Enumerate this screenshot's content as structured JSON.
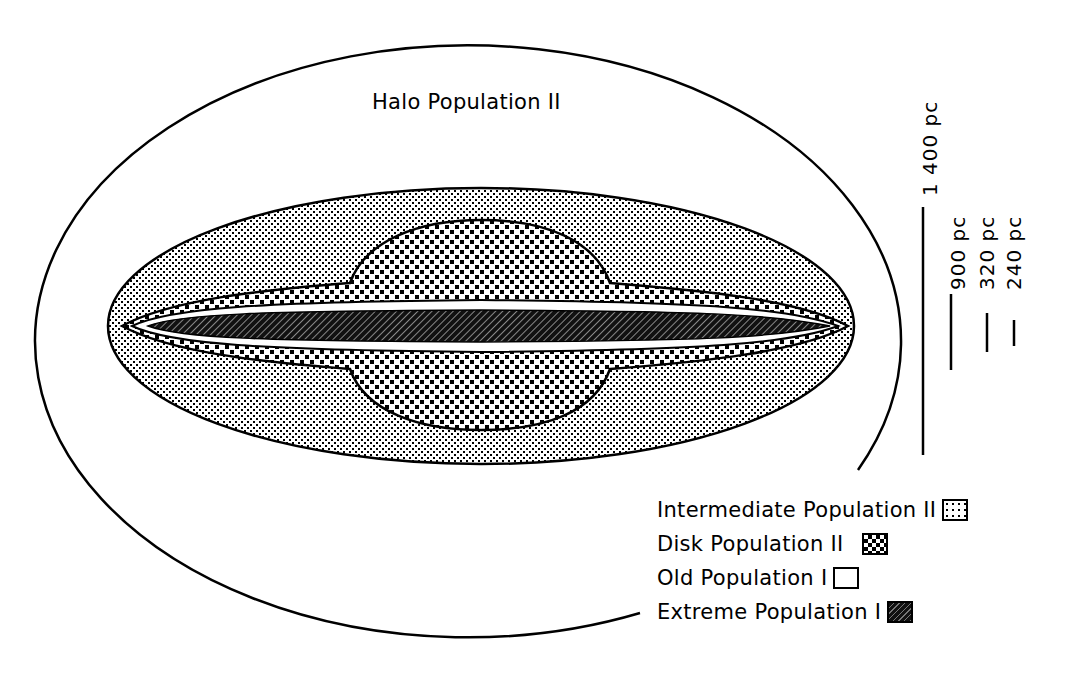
{
  "diagram": {
    "halo_label": "Halo Population II",
    "regions": [
      {
        "name": "Halo Population II",
        "pattern": "blank",
        "shape": "outer ellipse"
      },
      {
        "name": "Intermediate Population II",
        "pattern": "fine-dots",
        "shape": "thick lens ellipse"
      },
      {
        "name": "Disk Population II",
        "pattern": "checker",
        "shape": "thin disk + central bulge"
      },
      {
        "name": "Old Population I",
        "pattern": "white",
        "shape": "thin layer"
      },
      {
        "name": "Extreme Population I",
        "pattern": "dark-hatched",
        "shape": "thinnest mid-plane layer"
      }
    ],
    "scale_bars": [
      {
        "label": "1 400 pc",
        "value_pc": 1400
      },
      {
        "label": "900 pc",
        "value_pc": 900
      },
      {
        "label": "320 pc",
        "value_pc": 320
      },
      {
        "label": "240 pc",
        "value_pc": 240
      }
    ],
    "legend": [
      {
        "label": "Intermediate Population II",
        "swatch": "intermediate"
      },
      {
        "label": "Disk Population II",
        "swatch": "disk"
      },
      {
        "label": "Old Population I",
        "swatch": "old"
      },
      {
        "label": "Extreme Population I",
        "swatch": "extreme"
      }
    ],
    "colors": {
      "ink": "#000000",
      "paper": "#ffffff",
      "extreme_fill": "#111111"
    }
  }
}
